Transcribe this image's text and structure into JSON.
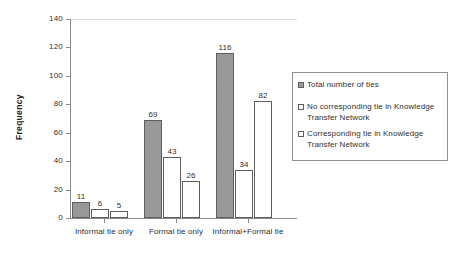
{
  "chart_data": {
    "type": "bar",
    "title": "",
    "xlabel": "",
    "ylabel": "Frequency",
    "ylim": [
      0,
      140
    ],
    "ytick_values": [
      0,
      20,
      40,
      60,
      80,
      100,
      120,
      140
    ],
    "ytick_labels": [
      "0",
      "20",
      "40",
      "60",
      "80",
      "100",
      "120",
      "140"
    ],
    "grid": "top-gridline-only",
    "legend_position": "right-inside",
    "categories": [
      "Informal tie only",
      "Formal tie only",
      "Informal+Formal tie"
    ],
    "series": [
      {
        "name": "Total number of ties",
        "swatch": "fill",
        "values": [
          11,
          69,
          116
        ],
        "labels": [
          "11",
          "69",
          "116"
        ]
      },
      {
        "name": "No corresponding tie in Knowledge Transfer Network",
        "swatch": "empty",
        "values": [
          6,
          43,
          34
        ],
        "labels": [
          "6",
          "43",
          "34"
        ]
      },
      {
        "name": "Corresponding tie in Knowledge Transfer Network",
        "swatch": "empty",
        "values": [
          5,
          26,
          82
        ],
        "labels": [
          "5",
          "26",
          "82"
        ]
      }
    ],
    "colors": {
      "series_fill": "#9c9c9c",
      "series_empty": "#ffffff",
      "bar_border": "#5e5e5e",
      "axis": "#8a8a8a",
      "gridline": "#e2e0dd",
      "text": "#2f2f2f"
    }
  },
  "axis": {
    "y_title": "Frequency",
    "y_labels": [
      "140",
      "120",
      "100",
      "80",
      "60",
      "40",
      "20",
      "0"
    ]
  },
  "categories": [
    {
      "label": "Informal tie only"
    },
    {
      "label": "Formal tie only"
    },
    {
      "label": "Informal+Formal tie"
    }
  ],
  "bars": [
    {
      "value_label": "11",
      "series": 0,
      "group": 0
    },
    {
      "value_label": "6",
      "series": 1,
      "group": 0
    },
    {
      "value_label": "5",
      "series": 2,
      "group": 0
    },
    {
      "value_label": "69",
      "series": 0,
      "group": 1
    },
    {
      "value_label": "43",
      "series": 1,
      "group": 1
    },
    {
      "value_label": "26",
      "series": 2,
      "group": 1
    },
    {
      "value_label": "116",
      "series": 0,
      "group": 2
    },
    {
      "value_label": "34",
      "series": 1,
      "group": 2
    },
    {
      "value_label": "82",
      "series": 2,
      "group": 2
    }
  ],
  "legend": {
    "entries": [
      {
        "label": "Total number of ties"
      },
      {
        "label": "No corresponding tie in Knowledge Transfer Network"
      },
      {
        "label": "Corresponding tie in Knowledge Transfer Network"
      }
    ]
  }
}
